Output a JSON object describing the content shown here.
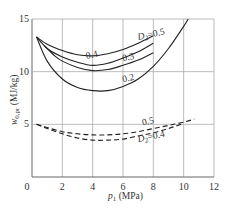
{
  "chart_data": {
    "type": "line",
    "title": "",
    "xlabel": "p1 (MPa)",
    "ylabel": "w0,pr (MJ/kg)",
    "xlim": [
      0,
      12
    ],
    "ylim": [
      0,
      15
    ],
    "xticks": [
      0,
      2,
      4,
      6,
      8,
      10,
      12
    ],
    "yticks": [
      0,
      5,
      10,
      15
    ],
    "grid": true,
    "legend": "inline labels",
    "series": [
      {
        "name": "D2=0.5",
        "style": "solid",
        "label": "D2=0.5",
        "x": [
          0.3,
          1,
          2,
          3,
          4,
          5,
          6,
          7,
          8
        ],
        "y": [
          13.3,
          12.6,
          12.0,
          11.6,
          11.5,
          11.7,
          12.1,
          12.7,
          13.4
        ]
      },
      {
        "name": "D2=0.4",
        "style": "solid",
        "label": "0.4",
        "x": [
          0.3,
          1,
          2,
          3,
          4,
          5,
          6,
          7,
          8
        ],
        "y": [
          13.3,
          12.2,
          11.4,
          10.9,
          10.6,
          10.8,
          11.3,
          11.9,
          12.7
        ]
      },
      {
        "name": "D2=0.3",
        "style": "solid",
        "label": "0.3",
        "x": [
          0.8,
          1.5,
          2,
          3,
          4,
          5,
          6,
          7,
          8
        ],
        "y": [
          12.5,
          11.5,
          11.0,
          10.4,
          10.1,
          10.2,
          10.6,
          11.1,
          11.8
        ]
      },
      {
        "name": "D2=0.2",
        "style": "solid",
        "label": "0.2",
        "x": [
          0.3,
          1,
          2,
          3,
          4,
          5,
          6,
          7,
          8,
          9,
          10,
          10.3
        ],
        "y": [
          13.3,
          11.0,
          9.3,
          8.5,
          8.2,
          8.2,
          8.6,
          9.3,
          10.5,
          12.2,
          14.3,
          15.0
        ]
      },
      {
        "name": "D2=0.5 (dashed)",
        "style": "dashed",
        "label": "0.5",
        "x": [
          0.3,
          1,
          2,
          3,
          4,
          5,
          6,
          7,
          8,
          9,
          10,
          10.7
        ],
        "y": [
          5.0,
          4.7,
          4.3,
          4.1,
          4.0,
          4.0,
          4.1,
          4.3,
          4.6,
          4.9,
          5.2,
          5.5
        ]
      },
      {
        "name": "D2=0.4 (dashed)",
        "style": "dashed",
        "label": "D2=0.4",
        "x": [
          0.3,
          1,
          2,
          3,
          4,
          5,
          6,
          7,
          8,
          9,
          10
        ],
        "y": [
          5.0,
          4.6,
          4.1,
          3.7,
          3.5,
          3.5,
          3.6,
          3.9,
          4.2,
          4.6,
          5.1
        ]
      }
    ],
    "annotations": [
      {
        "text": "D2=0.5",
        "x": 7.0,
        "y": 13.0
      },
      {
        "text": "0.4",
        "x": 3.6,
        "y": 11.2
      },
      {
        "text": "0.3",
        "x": 6.0,
        "y": 11.0
      },
      {
        "text": "0.2",
        "x": 6.0,
        "y": 9.0
      },
      {
        "text": "0.5",
        "x": 7.3,
        "y": 4.9
      },
      {
        "text": "D2=0.4",
        "x": 7.0,
        "y": 3.3
      }
    ]
  },
  "axes": {
    "x_label_main": "p",
    "x_label_sub": "1",
    "x_label_unit": " (MPa)",
    "y_label_main": "w",
    "y_label_sub": "0,pr",
    "y_label_unit": " (MJ/kg)"
  }
}
